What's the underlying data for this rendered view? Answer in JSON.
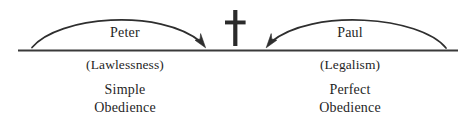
{
  "diagram": {
    "type": "conceptual-balance-diagram",
    "colors": {
      "ink": "#1f1f1f",
      "stroke": "#3a3a3a",
      "background": "#ffffff"
    },
    "center_symbol": {
      "name": "cross-icon",
      "label": "Christian cross"
    },
    "baseline": {
      "name": "horizontal-baseline"
    },
    "left": {
      "arc_label": "Peter",
      "paren_label": "(Lawlessness)",
      "outcome_line1": "Simple",
      "outcome_line2": "Obedience",
      "arrow_direction": "right"
    },
    "right": {
      "arc_label": "Paul",
      "paren_label": "(Legalism)",
      "outcome_line1": "Perfect",
      "outcome_line2": "Obedience",
      "arrow_direction": "left"
    }
  }
}
